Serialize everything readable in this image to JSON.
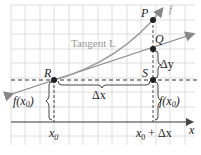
{
  "diagram": {
    "type": "derivative-secant-tangent",
    "labels": {
      "P": "P",
      "Q": "Q",
      "R": "R",
      "S": "S",
      "f": "f",
      "tangent": "Tangent L",
      "dy": "Δy",
      "dx": "Δx",
      "fx0_left": "f(x",
      "fx0_left_sub": "0",
      "fx0_left_close": ")",
      "fx0_right": "f(x",
      "fx0_right_sub": "0",
      "fx0_right_close": ")",
      "x0": "x",
      "x0_sub": "0",
      "x0dx": "x",
      "x0dx_sub": "0",
      "x0dx_rest": " + Δx",
      "x_axis": "x"
    },
    "colors": {
      "grid": "#d9d9d9",
      "curve": "#9a9a9a",
      "axis": "#333333",
      "tangent": "#888888",
      "point": "#222222"
    }
  }
}
